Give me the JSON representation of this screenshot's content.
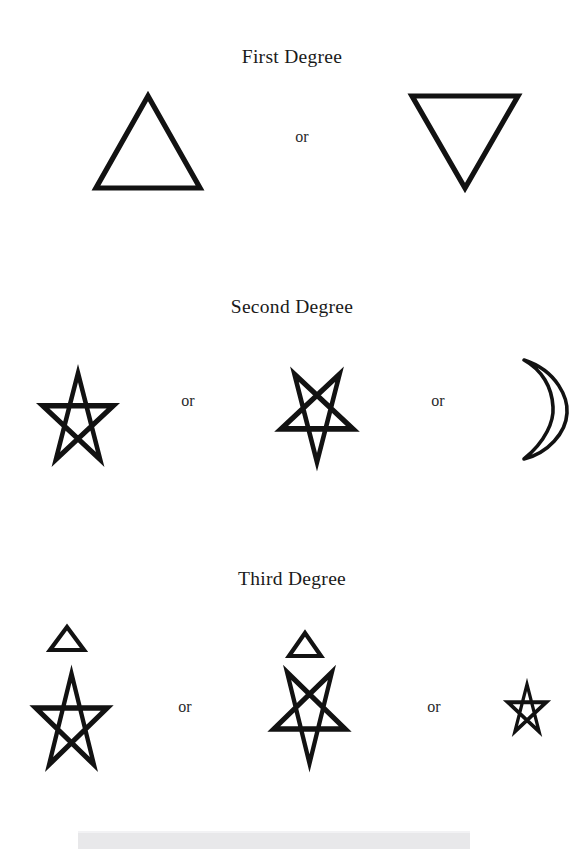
{
  "page": {
    "width": 584,
    "height": 849,
    "background": "#ffffff",
    "ink_color": "#111111",
    "clipped_header_text": "· · ·"
  },
  "sections": [
    {
      "id": "first-degree",
      "heading": "First Degree",
      "heading_y": 58,
      "figures": [
        {
          "name": "upward-triangle",
          "shape": "triangle-up",
          "x": 92,
          "y": 92,
          "w": 112,
          "h": 100,
          "stroke": 5.2
        },
        {
          "name": "downward-triangle",
          "shape": "triangle-down",
          "x": 408,
          "y": 92,
          "w": 114,
          "h": 100,
          "stroke": 5.2
        }
      ],
      "connectors": [
        {
          "label": "or",
          "x": 282,
          "y": 128
        }
      ]
    },
    {
      "id": "second-degree",
      "heading": "Second Degree",
      "heading_y": 308,
      "figures": [
        {
          "name": "upright-pentagram",
          "shape": "pentagram-up",
          "x": 18,
          "y": 355,
          "w": 120,
          "h": 108,
          "stroke": 4.6
        },
        {
          "name": "inverted-pentagram",
          "shape": "pentagram-down",
          "x": 258,
          "y": 355,
          "w": 118,
          "h": 110,
          "stroke": 4.6
        },
        {
          "name": "crescent-moon",
          "shape": "crescent",
          "x": 512,
          "y": 355,
          "w": 62,
          "h": 108,
          "stroke": 3.6
        }
      ],
      "connectors": [
        {
          "label": "or",
          "x": 168,
          "y": 392
        },
        {
          "label": "or",
          "x": 418,
          "y": 392
        }
      ]
    },
    {
      "id": "third-degree",
      "heading": "Third Degree",
      "heading_y": 580,
      "figures": [
        {
          "name": "small-triangle-over-upright-pentagram",
          "shape": "triangle-over-pentagram-up",
          "x": 12,
          "y": 624,
          "w": 118,
          "h": 145,
          "stroke": 4.4
        },
        {
          "name": "small-triangle-over-inverted-pentagram",
          "shape": "triangle-over-pentagram-down",
          "x": 252,
          "y": 630,
          "w": 116,
          "h": 148,
          "stroke": 4.4
        },
        {
          "name": "small-upright-pentagram",
          "shape": "pentagram-up-small",
          "x": 496,
          "y": 674,
          "w": 62,
          "h": 60,
          "stroke": 3.2
        }
      ],
      "connectors": [
        {
          "label": "or",
          "x": 165,
          "y": 698
        },
        {
          "label": "or",
          "x": 414,
          "y": 698
        }
      ]
    }
  ],
  "scan_artifact": {
    "name": "scanner-edge-band",
    "x": 78,
    "y": 831,
    "width": 392,
    "height": 18,
    "color": "#e8e8ea"
  }
}
